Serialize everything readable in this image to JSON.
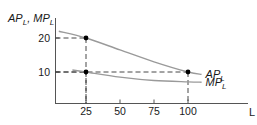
{
  "chart_data": {
    "type": "line",
    "title": "",
    "ylabel": "AP_L, MP_L",
    "ylabel_parts": {
      "a": "AP",
      "a_sub": "L",
      "sep": ", ",
      "b": "MP",
      "b_sub": "L"
    },
    "xlabel": "L",
    "x_ticks": [
      25,
      50,
      75,
      100
    ],
    "y_ticks": [
      10,
      20
    ],
    "x_tick_labels": [
      "25",
      "50",
      "75",
      "100"
    ],
    "y_tick_labels": [
      "10",
      "20"
    ],
    "grid": false,
    "series": [
      {
        "name": "AP_L",
        "label": "AP",
        "sub": "L",
        "points": [
          [
            5,
            22
          ],
          [
            25,
            20
          ],
          [
            50,
            16.5
          ],
          [
            75,
            13
          ],
          [
            100,
            10
          ],
          [
            110,
            9.3
          ]
        ]
      },
      {
        "name": "MP_L",
        "label": "MP",
        "sub": "L",
        "points": [
          [
            15,
            10.6
          ],
          [
            25,
            10
          ],
          [
            50,
            8.5
          ],
          [
            75,
            7.5
          ],
          [
            100,
            7.1
          ],
          [
            110,
            7.0
          ]
        ]
      }
    ],
    "marked_points": [
      {
        "x": 25,
        "y": 20,
        "series": "AP_L"
      },
      {
        "x": 25,
        "y": 10,
        "series": "MP_L"
      },
      {
        "x": 100,
        "y": 10,
        "series": "AP_L"
      }
    ],
    "annotations": "Dashed guide lines from marked points to both axes",
    "colors": {
      "curve": "#9a9a9a",
      "axis": "#555555",
      "dash": "#333333",
      "point": "#000000"
    }
  }
}
